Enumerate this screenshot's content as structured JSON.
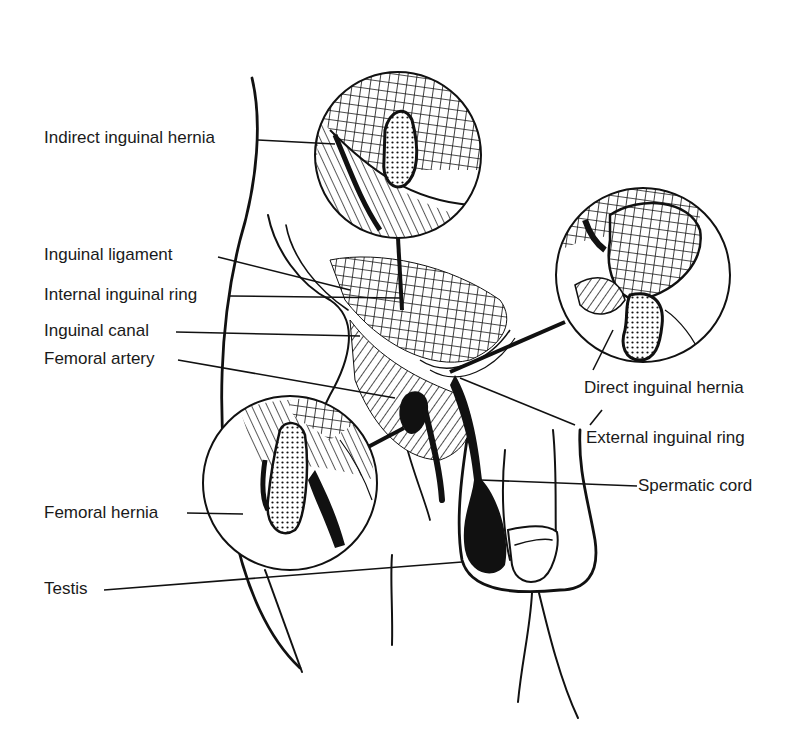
{
  "diagram": {
    "style": "black-and-white line illustration",
    "colors": {
      "ink": "#111111",
      "background": "#ffffff",
      "label_text": "#1a1a1a"
    },
    "labels": [
      {
        "id": "indirect-inguinal-hernia",
        "text": "Indirect inguinal hernia",
        "side": "left"
      },
      {
        "id": "inguinal-ligament",
        "text": "Inguinal ligament",
        "side": "left"
      },
      {
        "id": "internal-inguinal-ring",
        "text": "Internal inguinal ring",
        "side": "left"
      },
      {
        "id": "inguinal-canal",
        "text": "Inguinal canal",
        "side": "left"
      },
      {
        "id": "femoral-artery",
        "text": "Femoral artery",
        "side": "left"
      },
      {
        "id": "femoral-hernia",
        "text": "Femoral hernia",
        "side": "left"
      },
      {
        "id": "testis",
        "text": "Testis",
        "side": "left"
      },
      {
        "id": "direct-inguinal-hernia",
        "text": "Direct inguinal hernia",
        "side": "right"
      },
      {
        "id": "external-inguinal-ring",
        "text": "External inguinal ring",
        "side": "right"
      },
      {
        "id": "spermatic-cord",
        "text": "Spermatic cord",
        "side": "right"
      }
    ],
    "insets": [
      {
        "id": "inset-indirect-hernia",
        "shows": "Indirect inguinal hernia"
      },
      {
        "id": "inset-direct-hernia",
        "shows": "Direct inguinal hernia"
      },
      {
        "id": "inset-femoral-hernia",
        "shows": "Femoral hernia"
      }
    ]
  }
}
